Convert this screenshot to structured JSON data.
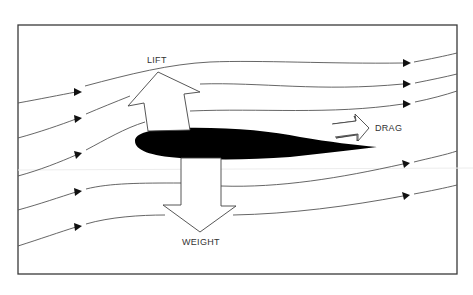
{
  "diagram": {
    "title": "",
    "labels": {
      "lift": "LIFT",
      "drag": "DRAG",
      "weight": "WEIGHT"
    },
    "elements": {
      "airfoil": "black airfoil cross-section",
      "streamlines_count": 7,
      "streamline_direction": "left-to-right",
      "force_arrows": [
        "lift (up, tilted back)",
        "drag (right)",
        "weight (down)"
      ]
    },
    "colors": {
      "background": "#ffffff",
      "frame": "#3a3a3a",
      "airfoil": "#000000",
      "lines": "#555555",
      "text": "#333333"
    }
  }
}
